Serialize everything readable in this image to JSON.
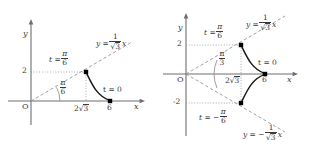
{
  "figure": {
    "background_color": "#ffffff",
    "stroke_color": "#4a4a4a",
    "curve_color": "#1a1a1a",
    "dash_color": "#8a8a8a",
    "dot_color": "#000000"
  },
  "panels": [
    {
      "id": "left",
      "axes": {
        "x_axis_label": "x",
        "y_axis_label": "y",
        "origin_label": "O"
      },
      "ticks": {
        "y": [
          {
            "label": "2",
            "value": 2
          }
        ],
        "x": [
          {
            "label_prefix": "2",
            "label_radicand": "3",
            "value": 3.4641,
            "display": "2√3"
          },
          {
            "label": "6",
            "value": 6
          }
        ]
      },
      "annotations": {
        "line_label": {
          "lhs": "y =",
          "num": "1",
          "den_radicand": "3",
          "rhs": "x",
          "display": "y = (1/√3)x"
        },
        "angle_label": {
          "num": "π",
          "den": "6",
          "display": "π/6"
        },
        "point_upper": {
          "lhs": "t =",
          "num": "π",
          "den": "6",
          "display": "t = π/6"
        },
        "point_right": {
          "display": "t = 0"
        }
      },
      "points": [
        {
          "name": "t-pi-over-6",
          "x": 3.4641,
          "y": 2
        },
        {
          "name": "t-zero",
          "x": 6,
          "y": 0
        }
      ],
      "curve": {
        "from_t": "π/6",
        "to_t": "0",
        "from_point": [
          3.4641,
          2
        ],
        "to_point": [
          6,
          0
        ]
      }
    },
    {
      "id": "right",
      "axes": {
        "x_axis_label": "x",
        "y_axis_label": "y",
        "origin_label": "O"
      },
      "ticks": {
        "y": [
          {
            "label": "2",
            "value": 2
          },
          {
            "label": "-2",
            "value": -2
          }
        ],
        "x": [
          {
            "label_prefix": "2",
            "label_radicand": "3",
            "value": 3.4641,
            "display": "2√3"
          },
          {
            "label": "6",
            "value": 6
          }
        ]
      },
      "annotations": {
        "line_label_upper": {
          "lhs": "y =",
          "num": "1",
          "den_radicand": "3",
          "rhs": "x",
          "display": "y = (1/√3)x"
        },
        "line_label_lower": {
          "lhs": "y = −",
          "num": "1",
          "den_radicand": "3",
          "rhs": "x",
          "display": "y = -(1/√3)x"
        },
        "angle_label": {
          "num": "π",
          "den": "3",
          "display": "π/3"
        },
        "point_upper": {
          "lhs": "t =",
          "num": "π",
          "den": "6",
          "display": "t = π/6"
        },
        "point_lower": {
          "lhs": "t = −",
          "num": "π",
          "den": "6",
          "display": "t = -π/6"
        },
        "point_right": {
          "display": "t = 0"
        }
      },
      "points": [
        {
          "name": "t-pi-over-6",
          "x": 3.4641,
          "y": 2
        },
        {
          "name": "t-zero",
          "x": 6,
          "y": 0
        },
        {
          "name": "t-neg-pi-over-6",
          "x": 3.4641,
          "y": -2
        }
      ],
      "curve": {
        "from_t": "π/6",
        "through_t": "0",
        "to_t": "-π/6"
      }
    }
  ]
}
